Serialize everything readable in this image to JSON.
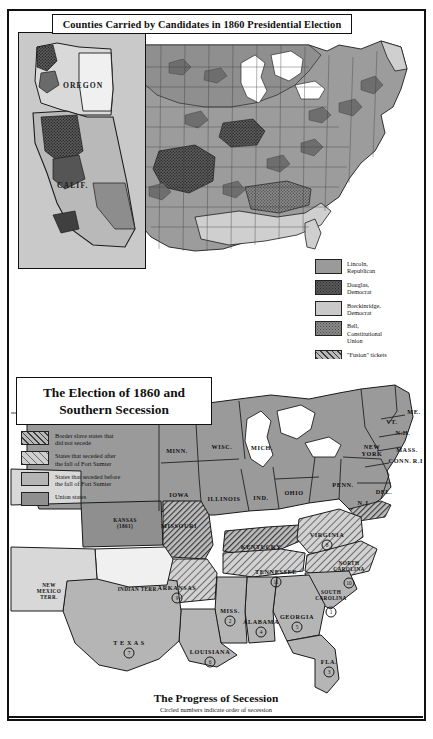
{
  "top_map": {
    "title": "Counties Carried by Candidates in 1860 Presidential Election",
    "inset_labels": [
      {
        "name": "OREGON",
        "x": 74,
        "y": 57
      },
      {
        "name": "CALIF.",
        "x": 55,
        "y": 155
      }
    ],
    "legend": [
      {
        "key": "lincoln",
        "label": "Lincoln,\nRepublican",
        "swatch": "solid-mid-gray"
      },
      {
        "key": "douglas",
        "label": "Douglas,\nDemocrat",
        "swatch": "dark-dotted"
      },
      {
        "key": "breck",
        "label": "Breckinridge,\nDemocrat",
        "swatch": "light-gray"
      },
      {
        "key": "bell",
        "label": "Bell,\nConstitutional\nUnion",
        "swatch": "mid-dotted"
      },
      {
        "key": "fusion",
        "label": "\"Fusion\" tickets",
        "swatch": "hatched"
      },
      {
        "key": "none",
        "label": "No returns,\nUnsettled, etc.",
        "swatch": "very-light"
      }
    ]
  },
  "bottom_map": {
    "title_line1": "The Election of 1860 and",
    "title_line2": "Southern Secession",
    "legend": [
      {
        "key": "border",
        "label": "Border slave states that\ndid not secede",
        "swatch": "hatch-dark"
      },
      {
        "key": "seceded_after",
        "label": "States that seceded after\nthe fall of Fort Sumter",
        "swatch": "hatch-light"
      },
      {
        "key": "seceded_before",
        "label": "States that seceded before\nthe fall of Fort Sumter",
        "swatch": "light-gray"
      },
      {
        "key": "union",
        "label": "Union states",
        "swatch": "mid-gray"
      }
    ],
    "caption_title": "The Progress of Secession",
    "caption_sub": "Circled numbers indicate order of secession",
    "states": [
      {
        "name": "MINN.",
        "x": 168,
        "y": 91,
        "cls": "union",
        "num": null
      },
      {
        "name": "WISC.",
        "x": 213,
        "y": 87,
        "cls": "union",
        "num": null
      },
      {
        "name": "MICH.",
        "x": 253,
        "y": 88,
        "cls": "union",
        "num": null
      },
      {
        "name": "IOWA",
        "x": 170,
        "y": 135,
        "cls": "union",
        "num": null
      },
      {
        "name": "ILLINOIS",
        "x": 215,
        "y": 139,
        "cls": "union",
        "num": null
      },
      {
        "name": "IND.",
        "x": 252,
        "y": 138,
        "cls": "union",
        "num": null
      },
      {
        "name": "OHIO",
        "x": 285,
        "y": 133,
        "cls": "union",
        "num": null
      },
      {
        "name": "PENN.",
        "x": 334,
        "y": 125,
        "cls": "union",
        "num": null
      },
      {
        "name": "NEW\nYORK",
        "x": 363,
        "y": 91,
        "cls": "union",
        "num": null
      },
      {
        "name": "VT.",
        "x": 383,
        "y": 62,
        "cls": "union",
        "num": null
      },
      {
        "name": "ME.",
        "x": 405,
        "y": 52,
        "cls": "union",
        "num": null
      },
      {
        "name": "N.H.",
        "x": 394,
        "y": 73,
        "cls": "union",
        "num": null
      },
      {
        "name": "MASS.",
        "x": 398,
        "y": 90,
        "cls": "union",
        "num": null
      },
      {
        "name": "CONN.",
        "x": 391,
        "y": 101,
        "cls": "union",
        "num": null
      },
      {
        "name": "R.I.",
        "x": 410,
        "y": 101,
        "cls": "union",
        "num": null
      },
      {
        "name": "N.J.",
        "x": 355,
        "y": 143,
        "cls": "union",
        "num": null
      },
      {
        "name": "DEL.",
        "x": 375,
        "y": 132,
        "cls": "border",
        "num": null
      },
      {
        "name": "KANSAS\n(1861)",
        "x": 116,
        "y": 164,
        "cls": "union",
        "num": null
      },
      {
        "name": "MISSOURI",
        "x": 170,
        "y": 166,
        "cls": "border",
        "num": null
      },
      {
        "name": "KENTUCKY",
        "x": 252,
        "y": 187,
        "cls": "border",
        "num": null
      },
      {
        "name": "VIRGINIA",
        "x": 318,
        "y": 175,
        "cls": "seceded_after",
        "num": "8"
      },
      {
        "name": "NORTH\nCAROLINA",
        "x": 340,
        "y": 207,
        "cls": "seceded_after",
        "num": "10"
      },
      {
        "name": "TENNESSEE",
        "x": 267,
        "y": 212,
        "cls": "seceded_after",
        "num": "11"
      },
      {
        "name": "SOUTH\nCAROLINA",
        "x": 322,
        "y": 236,
        "cls": "seceded_before",
        "num": "1"
      },
      {
        "name": "GEORGIA",
        "x": 288,
        "y": 257,
        "cls": "seceded_before",
        "num": "5"
      },
      {
        "name": "ALABAMA",
        "x": 252,
        "y": 262,
        "cls": "seceded_before",
        "num": "4"
      },
      {
        "name": "MISS.",
        "x": 221,
        "y": 251,
        "cls": "seceded_before",
        "num": "2"
      },
      {
        "name": "ARKANSAS",
        "x": 168,
        "y": 228,
        "cls": "seceded_after",
        "num": "9"
      },
      {
        "name": "LOUISIANA",
        "x": 201,
        "y": 292,
        "cls": "seceded_before",
        "num": "6"
      },
      {
        "name": "T E X A S",
        "x": 120,
        "y": 283,
        "cls": "seceded_before",
        "num": "7"
      },
      {
        "name": "FLA.",
        "x": 320,
        "y": 302,
        "cls": "seceded_before",
        "num": "3"
      },
      {
        "name": "INDIAN TERR.",
        "x": 129,
        "y": 230,
        "cls": "none",
        "num": null
      },
      {
        "name": "NEW\nMEXICO\nTERR.",
        "x": 40,
        "y": 232,
        "cls": "none",
        "num": null
      }
    ]
  }
}
